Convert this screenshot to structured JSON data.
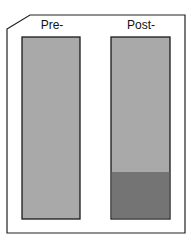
{
  "diagram": {
    "tubes": [
      {
        "label": "Pre-",
        "fill_color": "#a9a9a9",
        "sediment": false
      },
      {
        "label": "Post-",
        "fill_color": "#a9a9a9",
        "sediment": true,
        "sediment_color": "#747474",
        "sediment_fraction": 0.26
      }
    ],
    "frame_color": "#222222",
    "outline_color": "#1a1a1a"
  }
}
